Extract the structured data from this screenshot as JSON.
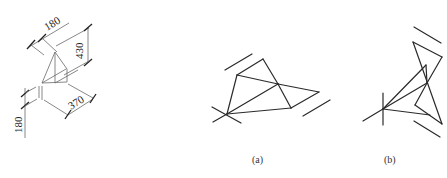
{
  "figure": {
    "left_drawing": {
      "dimensions": [
        {
          "label": "180",
          "position": "top-left"
        },
        {
          "label": "430",
          "position": "right-vertical"
        },
        {
          "label": "370",
          "position": "bottom-right"
        },
        {
          "label": "180",
          "position": "left-vertical"
        }
      ]
    },
    "panels": [
      {
        "id": "a",
        "caption": "(a)"
      },
      {
        "id": "b",
        "caption": "(b)"
      }
    ]
  },
  "geometry": {
    "panel_a": {
      "parallel_lines": [
        [
          225,
          70,
          252,
          54
        ],
        [
          303,
          116,
          330,
          100
        ]
      ],
      "edges": [
        [
          227,
          114,
          237,
          75
        ],
        [
          237,
          75,
          263,
          59
        ],
        [
          263,
          59,
          278,
          84
        ],
        [
          237,
          75,
          278,
          84
        ],
        [
          278,
          84,
          319,
          92
        ],
        [
          319,
          92,
          291,
          108
        ],
        [
          278,
          84,
          291,
          108
        ],
        [
          227,
          114,
          278,
          84
        ],
        [
          227,
          114,
          291,
          108
        ],
        [
          212,
          107,
          241,
          123
        ],
        [
          213,
          122,
          227,
          114
        ]
      ]
    },
    "panel_b": {
      "parallel_lines": [
        [
          414,
          27,
          441,
          43
        ],
        [
          414,
          121,
          440,
          137
        ]
      ],
      "edges": [
        [
          383,
          109,
          426,
          65
        ],
        [
          413,
          42,
          442,
          57
        ],
        [
          413,
          42,
          442,
          124
        ],
        [
          442,
          57,
          427,
          83
        ],
        [
          426,
          65,
          427,
          83
        ],
        [
          383,
          109,
          427,
          83
        ],
        [
          427,
          83,
          415,
          105
        ],
        [
          415,
          105,
          442,
          124
        ],
        [
          383,
          109,
          430,
          115
        ],
        [
          383,
          93,
          383,
          125
        ],
        [
          363,
          121,
          383,
          109
        ]
      ]
    }
  }
}
